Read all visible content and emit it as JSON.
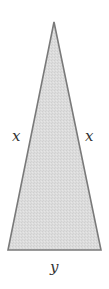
{
  "diagram": {
    "type": "isosceles-triangle",
    "fill_color": "#d9d9d9",
    "stroke_color": "#7a7a7a",
    "vertices": {
      "apex": [
        54,
        22
      ],
      "base_left": [
        8,
        250
      ],
      "base_right": [
        101,
        250
      ]
    },
    "labels": {
      "left_side": "x",
      "right_side": "x",
      "base": "y"
    }
  }
}
